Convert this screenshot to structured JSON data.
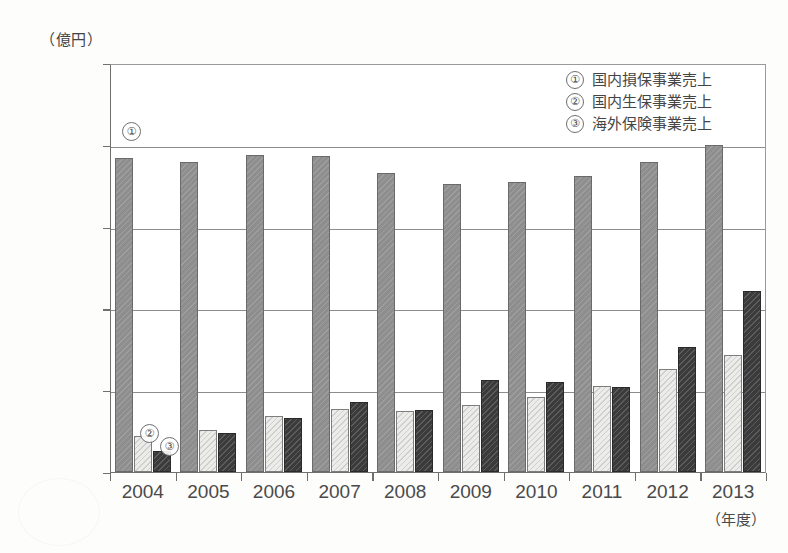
{
  "chart_data": {
    "type": "bar",
    "title": "",
    "subtitle": "",
    "unit_label": "（億円）",
    "xlabel": "（年度）",
    "ylabel": "",
    "ylim": [
      0,
      25000
    ],
    "ytick_values": [
      0,
      5000,
      10000,
      15000,
      20000,
      25000
    ],
    "ytick_labels": [
      "0",
      "5,000",
      "10,000",
      "15,000",
      "20,000",
      "25,000"
    ],
    "grid": true,
    "legend_position": "top-right",
    "categories": [
      "2004",
      "2005",
      "2006",
      "2007",
      "2008",
      "2009",
      "2010",
      "2011",
      "2012",
      "2013"
    ],
    "series": [
      {
        "name": "国内損保事業売上",
        "marker": "①",
        "color": "#8e8e8e",
        "values": [
          19200,
          18950,
          19400,
          19300,
          18300,
          17600,
          17700,
          18100,
          18950,
          20000
        ]
      },
      {
        "name": "国内生保事業売上",
        "marker": "②",
        "color": "#ececeb",
        "values": [
          2200,
          2550,
          3450,
          3850,
          3750,
          4100,
          4600,
          5250,
          6300,
          7150
        ]
      },
      {
        "name": "海外保険事業売上",
        "marker": "③",
        "color": "#3b3b3b",
        "values": [
          1300,
          2400,
          3300,
          4250,
          3800,
          5650,
          5500,
          5200,
          7650,
          11050
        ]
      }
    ],
    "annotations": [
      {
        "id": "callout-1",
        "text": "①"
      },
      {
        "id": "callout-2",
        "text": "②"
      },
      {
        "id": "callout-3",
        "text": "③"
      }
    ]
  },
  "legend": {
    "items": [
      {
        "marker": "①",
        "label": "国内損保事業売上"
      },
      {
        "marker": "②",
        "label": "国内生保事業売上"
      },
      {
        "marker": "③",
        "label": "海外保険事業売上"
      }
    ]
  }
}
